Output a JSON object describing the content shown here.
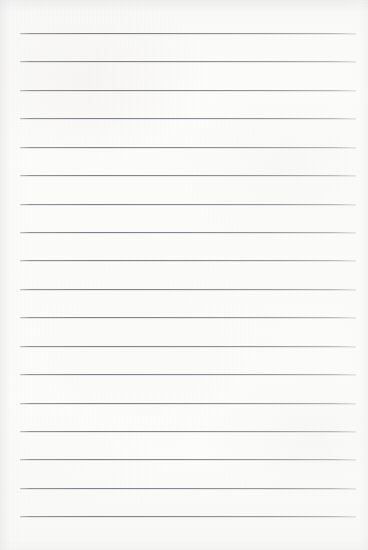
{
  "document": {
    "type": "ruled-notebook-paper",
    "title": "Lined Notebook Page",
    "content_text": "",
    "is_blank": true
  },
  "page": {
    "width": 368,
    "height": 550,
    "background_color": "#fbfbfa",
    "paper_tint": "#f9f9f8"
  },
  "rules": {
    "count": 18,
    "color": "#85858b",
    "thickness_px": 1,
    "first_line_y": 33,
    "spacing_px": 28.4,
    "line_start_x": 20,
    "line_end_x": 356,
    "margins": {
      "left_px": 20,
      "right_px": 12,
      "top_px": 33,
      "bottom_px": 34
    },
    "lines": [
      {
        "index": 1,
        "y": 33,
        "text": ""
      },
      {
        "index": 2,
        "y": 61,
        "text": ""
      },
      {
        "index": 3,
        "y": 90,
        "text": ""
      },
      {
        "index": 4,
        "y": 118,
        "text": ""
      },
      {
        "index": 5,
        "y": 147,
        "text": ""
      },
      {
        "index": 6,
        "y": 175,
        "text": ""
      },
      {
        "index": 7,
        "y": 204,
        "text": ""
      },
      {
        "index": 8,
        "y": 232,
        "text": ""
      },
      {
        "index": 9,
        "y": 260,
        "text": ""
      },
      {
        "index": 10,
        "y": 289,
        "text": ""
      },
      {
        "index": 11,
        "y": 317,
        "text": ""
      },
      {
        "index": 12,
        "y": 346,
        "text": ""
      },
      {
        "index": 13,
        "y": 374,
        "text": ""
      },
      {
        "index": 14,
        "y": 403,
        "text": ""
      },
      {
        "index": 15,
        "y": 431,
        "text": ""
      },
      {
        "index": 16,
        "y": 459,
        "text": ""
      },
      {
        "index": 17,
        "y": 488,
        "text": ""
      },
      {
        "index": 18,
        "y": 516,
        "text": ""
      }
    ]
  }
}
